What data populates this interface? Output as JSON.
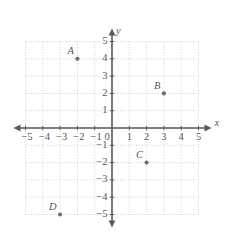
{
  "chart_data": {
    "type": "scatter",
    "title": "",
    "xlabel": "x",
    "ylabel": "y",
    "xlim": [
      -5,
      5
    ],
    "ylim": [
      -5,
      5
    ],
    "grid": true,
    "grid_style": "dotted",
    "legend": "none",
    "x_ticks": [
      "−5",
      "−4",
      "−3",
      "−2",
      "−1",
      "0",
      "1",
      "2",
      "3",
      "4",
      "5"
    ],
    "x_tick_values": [
      -5,
      -4,
      -3,
      -2,
      -1,
      0,
      1,
      2,
      3,
      4,
      5
    ],
    "y_ticks": [
      "5",
      "4",
      "3",
      "2",
      "1",
      "−1",
      "−2",
      "−3",
      "−4",
      "−5"
    ],
    "y_tick_values": [
      5,
      4,
      3,
      2,
      1,
      -1,
      -2,
      -3,
      -4,
      -5
    ],
    "origin_label": "0",
    "points": [
      {
        "label": "A",
        "x": -2,
        "y": 4
      },
      {
        "label": "B",
        "x": 3,
        "y": 2
      },
      {
        "label": "C",
        "x": 2,
        "y": -2
      },
      {
        "label": "D",
        "x": -3,
        "y": -5
      }
    ]
  },
  "colors": {
    "axis": "#5a5a5a",
    "grid": "#c9c9c9",
    "point": "#6e6e6e",
    "text": "#575757",
    "background": "#ffffff"
  },
  "geometry": {
    "origin_x": 112,
    "origin_y": 128,
    "unit": 17.3
  }
}
